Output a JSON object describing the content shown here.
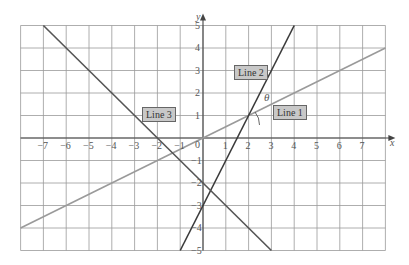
{
  "chart_data": {
    "type": "line",
    "title": "",
    "xlabel": "x",
    "ylabel": "y",
    "xlim": [
      -8,
      8
    ],
    "ylim": [
      -5,
      5
    ],
    "grid": true,
    "x_ticks": [
      -7,
      -6,
      -5,
      -4,
      -3,
      -2,
      -1,
      0,
      1,
      2,
      3,
      4,
      5,
      6,
      7
    ],
    "y_ticks": [
      -5,
      -4,
      -3,
      -2,
      -1,
      0,
      1,
      2,
      3,
      4,
      5
    ],
    "series": [
      {
        "name": "Line 1",
        "equation": "y = 0.5x",
        "x": [
          -8,
          8
        ],
        "y": [
          -4,
          4
        ],
        "color": "#9a9a9a"
      },
      {
        "name": "Line 2",
        "equation": "y = 2x - 3",
        "x": [
          -1,
          4
        ],
        "y": [
          -5,
          5
        ],
        "color": "#3a3a3a"
      },
      {
        "name": "Line 3",
        "equation": "y = -x - 2",
        "x": [
          -7,
          3
        ],
        "y": [
          5,
          -5
        ],
        "color": "#555555"
      }
    ],
    "annotations": [
      {
        "text": "θ",
        "x": 2.9,
        "y": 2.0,
        "note": "angle between Line 1 and Line 2 at (2, 1)"
      }
    ]
  },
  "labels": {
    "x_axis": "x",
    "y_axis": "y",
    "theta": "θ",
    "line1": "Line 1",
    "line2": "Line 2",
    "line3": "Line 3",
    "x_ticks": [
      "−7",
      "−6",
      "−5",
      "−4",
      "−3",
      "−2",
      "−1",
      "0",
      "1",
      "2",
      "3",
      "4",
      "5",
      "6",
      "7"
    ],
    "y_ticks_pos": [
      "5",
      "4",
      "3",
      "2",
      "1"
    ],
    "y_ticks_neg": [
      "−1",
      "−2",
      "−3",
      "−4",
      "−5"
    ]
  }
}
